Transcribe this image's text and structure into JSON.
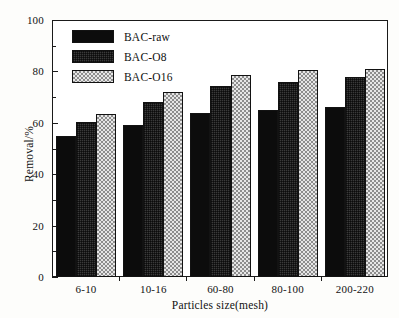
{
  "chart_data": {
    "type": "bar",
    "title": "",
    "xlabel": "Particles size(mesh)",
    "ylabel": "Removal/%",
    "categories": [
      "6-10",
      "10-16",
      "60-80",
      "80-100",
      "200-220"
    ],
    "series": [
      {
        "name": "BAC-raw",
        "values": [
          55,
          59,
          64,
          65,
          66
        ],
        "pattern": "solid-black",
        "color": "#0c0c0c"
      },
      {
        "name": "BAC-O8",
        "values": [
          60.5,
          68,
          74.5,
          76,
          78
        ],
        "pattern": "dense-dotted",
        "color": "#3a3a3a"
      },
      {
        "name": "BAC-O16",
        "values": [
          63.5,
          72,
          78.5,
          80.5,
          81
        ],
        "pattern": "checkered",
        "color": "#d8d8d8"
      }
    ],
    "ylim": [
      0,
      100
    ],
    "y_ticks": [
      0,
      20,
      40,
      60,
      80,
      100
    ],
    "y_tick_labels": [
      "0",
      "20",
      "40",
      "60",
      "80",
      "100"
    ],
    "y_minor_ticks": [
      10,
      30,
      50,
      70,
      90
    ],
    "grid": false,
    "legend_position": "top-left"
  }
}
